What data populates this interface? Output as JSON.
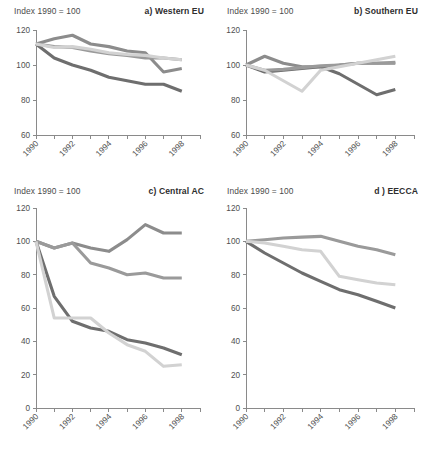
{
  "figure": {
    "index_label": "Index 1990 = 100",
    "colors": {
      "energy": "#8c8c8c",
      "industry": "#6e6e6e",
      "urban": "#9a9a9a",
      "agriculture": "#d2d2d2",
      "axis": "#8a8a8a",
      "text": "#4a4a4a",
      "background": "#ffffff"
    }
  },
  "chart_data": [
    {
      "type": "line",
      "panel": "a",
      "title": "a) Western EU",
      "ylabel": "Index 1990 = 100",
      "xlabel": "",
      "ylim": [
        60,
        120
      ],
      "yticks": [
        60,
        80,
        100,
        120
      ],
      "xlim": [
        1990,
        1999
      ],
      "xticks": [
        1990,
        1991,
        1992,
        1993,
        1994,
        1995,
        1996,
        1997,
        1998,
        1999
      ],
      "xticklabels": [
        "1990",
        "",
        "1992",
        "",
        "1994",
        "",
        "1996",
        "",
        "1998",
        ""
      ],
      "grid": false,
      "legend": "none",
      "x": [
        1990,
        1991,
        1992,
        1993,
        1994,
        1995,
        1996,
        1997,
        1998
      ],
      "series": [
        {
          "name": "Energy",
          "color": "#8c8c8c",
          "values": [
            112,
            115,
            117,
            112,
            110.5,
            108,
            107,
            96,
            98
          ]
        },
        {
          "name": "Industry",
          "color": "#6e6e6e",
          "values": [
            112,
            104,
            100,
            97,
            93,
            91,
            89,
            89,
            85
          ]
        },
        {
          "name": "Urban",
          "color": "#9a9a9a",
          "values": [
            112,
            110.5,
            110,
            108,
            106.5,
            105.5,
            104,
            104,
            103
          ]
        },
        {
          "name": "Agriculture",
          "color": "#d2d2d2",
          "values": [
            112,
            110,
            110.5,
            109,
            107,
            106,
            105.5,
            104,
            103
          ]
        }
      ]
    },
    {
      "type": "line",
      "panel": "b",
      "title": "b) Southern EU",
      "ylabel": "Index 1990 = 100",
      "xlabel": "",
      "ylim": [
        60,
        120
      ],
      "yticks": [
        60,
        80,
        100,
        120
      ],
      "xlim": [
        1990,
        1999
      ],
      "xticks": [
        1990,
        1991,
        1992,
        1993,
        1994,
        1995,
        1996,
        1997,
        1998,
        1999
      ],
      "xticklabels": [
        "1990",
        "",
        "1992",
        "",
        "1994",
        "",
        "1996",
        "",
        "1998",
        ""
      ],
      "grid": false,
      "legend": "none",
      "x": [
        1990,
        1991,
        1992,
        1993,
        1994,
        1995,
        1996,
        1997,
        1998
      ],
      "series": [
        {
          "name": "Energy",
          "color": "#8c8c8c",
          "values": [
            100,
            105,
            101,
            99,
            99,
            100,
            101,
            101,
            101
          ]
        },
        {
          "name": "Industry",
          "color": "#6e6e6e",
          "values": [
            100,
            96,
            97,
            98,
            99,
            95,
            89,
            83,
            86
          ]
        },
        {
          "name": "Urban",
          "color": "#9a9a9a",
          "values": [
            100,
            97,
            97.5,
            98.5,
            99.5,
            100,
            101,
            101,
            101.5
          ]
        },
        {
          "name": "Agriculture",
          "color": "#d2d2d2",
          "values": [
            100,
            97,
            91,
            85,
            97,
            99,
            101,
            103,
            105
          ]
        }
      ]
    },
    {
      "type": "line",
      "panel": "c",
      "title": "c) Central AC",
      "ylabel": "Index 1990 = 100",
      "xlabel": "",
      "ylim": [
        0,
        120
      ],
      "yticks": [
        0,
        20,
        40,
        60,
        80,
        100,
        120
      ],
      "xlim": [
        1990,
        1999
      ],
      "xticks": [
        1990,
        1991,
        1992,
        1993,
        1994,
        1995,
        1996,
        1997,
        1998,
        1999
      ],
      "xticklabels": [
        "1990",
        "",
        "1992",
        "",
        "1994",
        "",
        "1996",
        "",
        "1998",
        ""
      ],
      "grid": false,
      "legend": "inside-lower-left",
      "legend_items": [
        "Energy",
        "Industry",
        "Urban",
        "Agriculture"
      ],
      "x": [
        1990,
        1991,
        1992,
        1993,
        1994,
        1995,
        1996,
        1997,
        1998
      ],
      "series": [
        {
          "name": "Energy",
          "color": "#8c8c8c",
          "values": [
            100,
            96,
            99,
            96,
            94,
            101,
            110,
            105,
            105
          ]
        },
        {
          "name": "Industry",
          "color": "#6e6e6e",
          "values": [
            100,
            67,
            52,
            48,
            46,
            41,
            39,
            36,
            32
          ]
        },
        {
          "name": "Urban",
          "color": "#9a9a9a",
          "values": [
            100,
            96,
            99,
            87,
            84,
            80,
            81,
            78,
            78
          ]
        },
        {
          "name": "Agriculture",
          "color": "#d2d2d2",
          "values": [
            100,
            54,
            54,
            54,
            45,
            38,
            34,
            25,
            26
          ]
        }
      ]
    },
    {
      "type": "line",
      "panel": "d",
      "title": "d ) EECCA",
      "ylabel": "Index 1990 = 100",
      "xlabel": "",
      "ylim": [
        0,
        120
      ],
      "yticks": [
        0,
        20,
        40,
        60,
        80,
        100,
        120
      ],
      "xlim": [
        1990,
        1999
      ],
      "xticks": [
        1990,
        1991,
        1992,
        1993,
        1994,
        1995,
        1996,
        1997,
        1998,
        1999
      ],
      "xticklabels": [
        "1990",
        "",
        "1992",
        "",
        "1994",
        "",
        "1996",
        "",
        "1998",
        ""
      ],
      "grid": false,
      "legend": "inside-lower-left",
      "legend_items": [
        "Industry",
        "Urban",
        "Agriculture"
      ],
      "x": [
        1990,
        1991,
        1992,
        1993,
        1994,
        1995,
        1996,
        1997,
        1998
      ],
      "series": [
        {
          "name": "Industry",
          "color": "#6e6e6e",
          "values": [
            100,
            93,
            87,
            81,
            76,
            71,
            68,
            64,
            60
          ]
        },
        {
          "name": "Urban",
          "color": "#9a9a9a",
          "values": [
            100,
            101,
            102,
            102.5,
            103,
            100,
            97,
            95,
            92
          ]
        },
        {
          "name": "Agriculture",
          "color": "#d2d2d2",
          "values": [
            100,
            99,
            97,
            95,
            94,
            79,
            77,
            75,
            74
          ]
        }
      ]
    }
  ]
}
